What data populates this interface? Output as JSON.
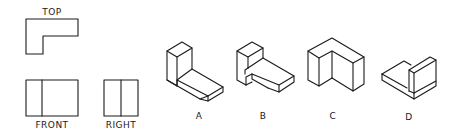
{
  "orthographic_views": {
    "top": {
      "label": "TOP"
    },
    "front": {
      "label": "FRONT"
    },
    "right": {
      "label": "RIGHT"
    }
  },
  "options": [
    {
      "id": "A",
      "label": "A"
    },
    {
      "id": "B",
      "label": "B"
    },
    {
      "id": "C",
      "label": "C"
    },
    {
      "id": "D",
      "label": "D"
    }
  ],
  "colors": {
    "line": "#1a1a1a",
    "background": "#ffffff"
  }
}
